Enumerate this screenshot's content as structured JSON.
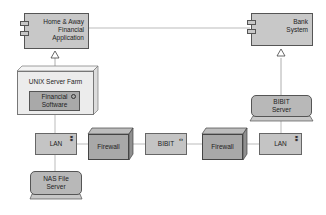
{
  "diagram": {
    "type": "deployment",
    "colors": {
      "component_fill": "#c8c8c8",
      "frame_fill": "#ececec",
      "node_fill": "#c4c4c4",
      "firewall_fill": "#a8a8a8",
      "line": "#bbbbbb",
      "border": "#555555"
    },
    "nodes": {
      "home_app": {
        "label_1": "Home & Away",
        "label_2": "Financial",
        "label_3": "Application"
      },
      "bank": {
        "label_1": "Bank",
        "label_2": "System"
      },
      "unix": {
        "label": "UNIX Server Farm"
      },
      "fin_sw": {
        "label_1": "Financial",
        "label_2": "Software"
      },
      "lan_left": {
        "label": "LAN",
        "icon": "network-icon"
      },
      "nas": {
        "label_1": "NAS File",
        "label_2": "Server"
      },
      "fw_left": {
        "label": "Firewall"
      },
      "bibit": {
        "label": "BIBIT",
        "icon": "interface-icon",
        "icon_glyph": "‹›"
      },
      "fw_right": {
        "label": "Firewall"
      },
      "lan_right": {
        "label": "LAN",
        "icon": "network-icon"
      },
      "bibit_server": {
        "label_1": "BIBIT",
        "label_2": "Server"
      }
    }
  }
}
